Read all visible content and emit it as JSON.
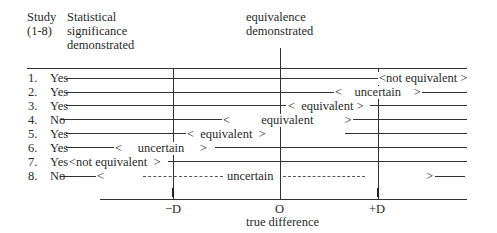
{
  "header": {
    "study_col": [
      "Study",
      "(1-8)"
    ],
    "significance_col": [
      "Statistical",
      "significance",
      "demonstrated"
    ],
    "equivalence_col": [
      "equivalence",
      "demonstrated"
    ]
  },
  "axis": {
    "minus_d": "−D",
    "zero": "O",
    "plus_d": "+D",
    "label": "true difference"
  },
  "rows": [
    {
      "num": "1.",
      "sig": "Yes",
      "interval_text": "<not equivalent >"
    },
    {
      "num": "2.",
      "sig": "Yes",
      "interval_text": "<    uncertain    >"
    },
    {
      "num": "3.",
      "sig": "Yes",
      "interval_text": "<  equivalent >"
    },
    {
      "num": "4.",
      "sig": "No",
      "interval_text": "<          equivalent          >"
    },
    {
      "num": "5.",
      "sig": "Yes",
      "interval_text": "<  equivalent  >"
    },
    {
      "num": "6.",
      "sig": "Yes",
      "interval_text": "<     uncertain     >"
    },
    {
      "num": "7.",
      "sig": "Yes",
      "interval_text": "<not equivalent  >"
    },
    {
      "num": "8.",
      "sig": "No",
      "interval_text": "uncertain"
    }
  ],
  "row8": {
    "left_bracket": "<",
    "right_bracket": ">"
  },
  "colors": {
    "line": "#333333",
    "text": "#2a2a2a",
    "background": "#ffffff"
  }
}
